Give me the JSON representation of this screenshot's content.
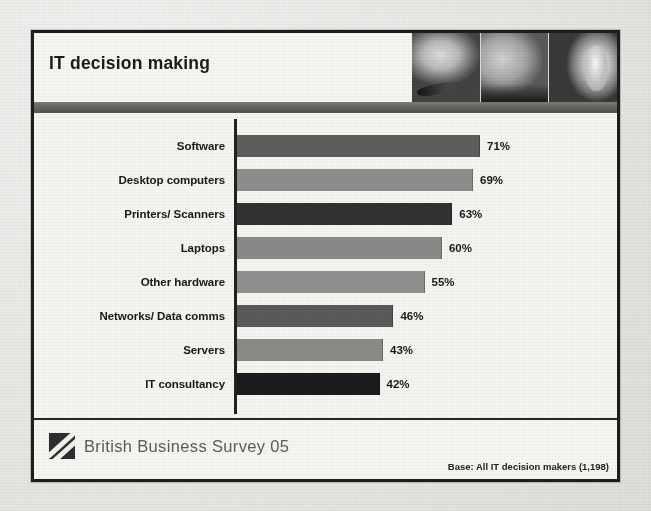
{
  "slide": {
    "title": "IT decision making",
    "header_photo_panels": [
      "photo-panel-1",
      "photo-panel-2",
      "photo-panel-3"
    ],
    "footer": {
      "logo_icon": "bbs-diagonal-logo-icon",
      "brand": "British Business Survey 05",
      "base_note": "Base: All IT decision makers (1,198)"
    }
  },
  "chart_data": {
    "type": "bar",
    "orientation": "horizontal",
    "title": "IT decision making",
    "subtitle": "",
    "xlabel": "",
    "ylabel": "",
    "xlim": [
      0,
      100
    ],
    "grid": false,
    "legend": null,
    "value_suffix": "%",
    "categories": [
      "Software",
      "Desktop computers",
      "Printers/ Scanners",
      "Laptops",
      "Other hardware",
      "Networks/ Data comms",
      "Servers",
      "IT consultancy"
    ],
    "values": [
      71,
      69,
      63,
      60,
      55,
      46,
      43,
      42
    ],
    "value_labels": [
      "71%",
      "69%",
      "63%",
      "60%",
      "55%",
      "46%",
      "43%",
      "42%"
    ],
    "bar_colors": [
      "#5e5e5c",
      "#8e8e8c",
      "#333335",
      "#8a8a88",
      "#90908e",
      "#595a5a",
      "#8b8b89",
      "#1b1b1d"
    ],
    "annotations": [
      "Base: All IT decision makers (1,198)"
    ],
    "colors": {
      "slide_border": "#1d1d1d",
      "header_band": "#65655f",
      "slide_background": "#f4f4f1",
      "text": "#17181a",
      "brand_text": "#5c5c5a"
    }
  }
}
